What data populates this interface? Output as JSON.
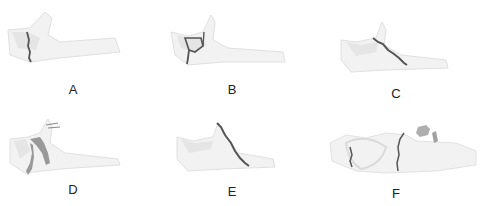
{
  "figure": {
    "panels": [
      {
        "id": "A",
        "label": "A",
        "description": "vertical fracture line through ramus"
      },
      {
        "id": "B",
        "label": "B",
        "description": "fracture with small fragment (Y-shaped)"
      },
      {
        "id": "C",
        "label": "C",
        "description": "oblique fracture line"
      },
      {
        "id": "D",
        "label": "D",
        "description": "comminuted fracture with displaced fragments"
      },
      {
        "id": "E",
        "label": "E",
        "description": "long oblique fracture line"
      },
      {
        "id": "F",
        "label": "F",
        "description": "multiple fracture lines with detached fragment"
      }
    ],
    "colors": {
      "bone_fill": "#f0f0f0",
      "bone_shade": "#d8d8d8",
      "fracture_line": "#555555",
      "fragment": "#8a8a8a",
      "label_text": "#222222"
    }
  }
}
